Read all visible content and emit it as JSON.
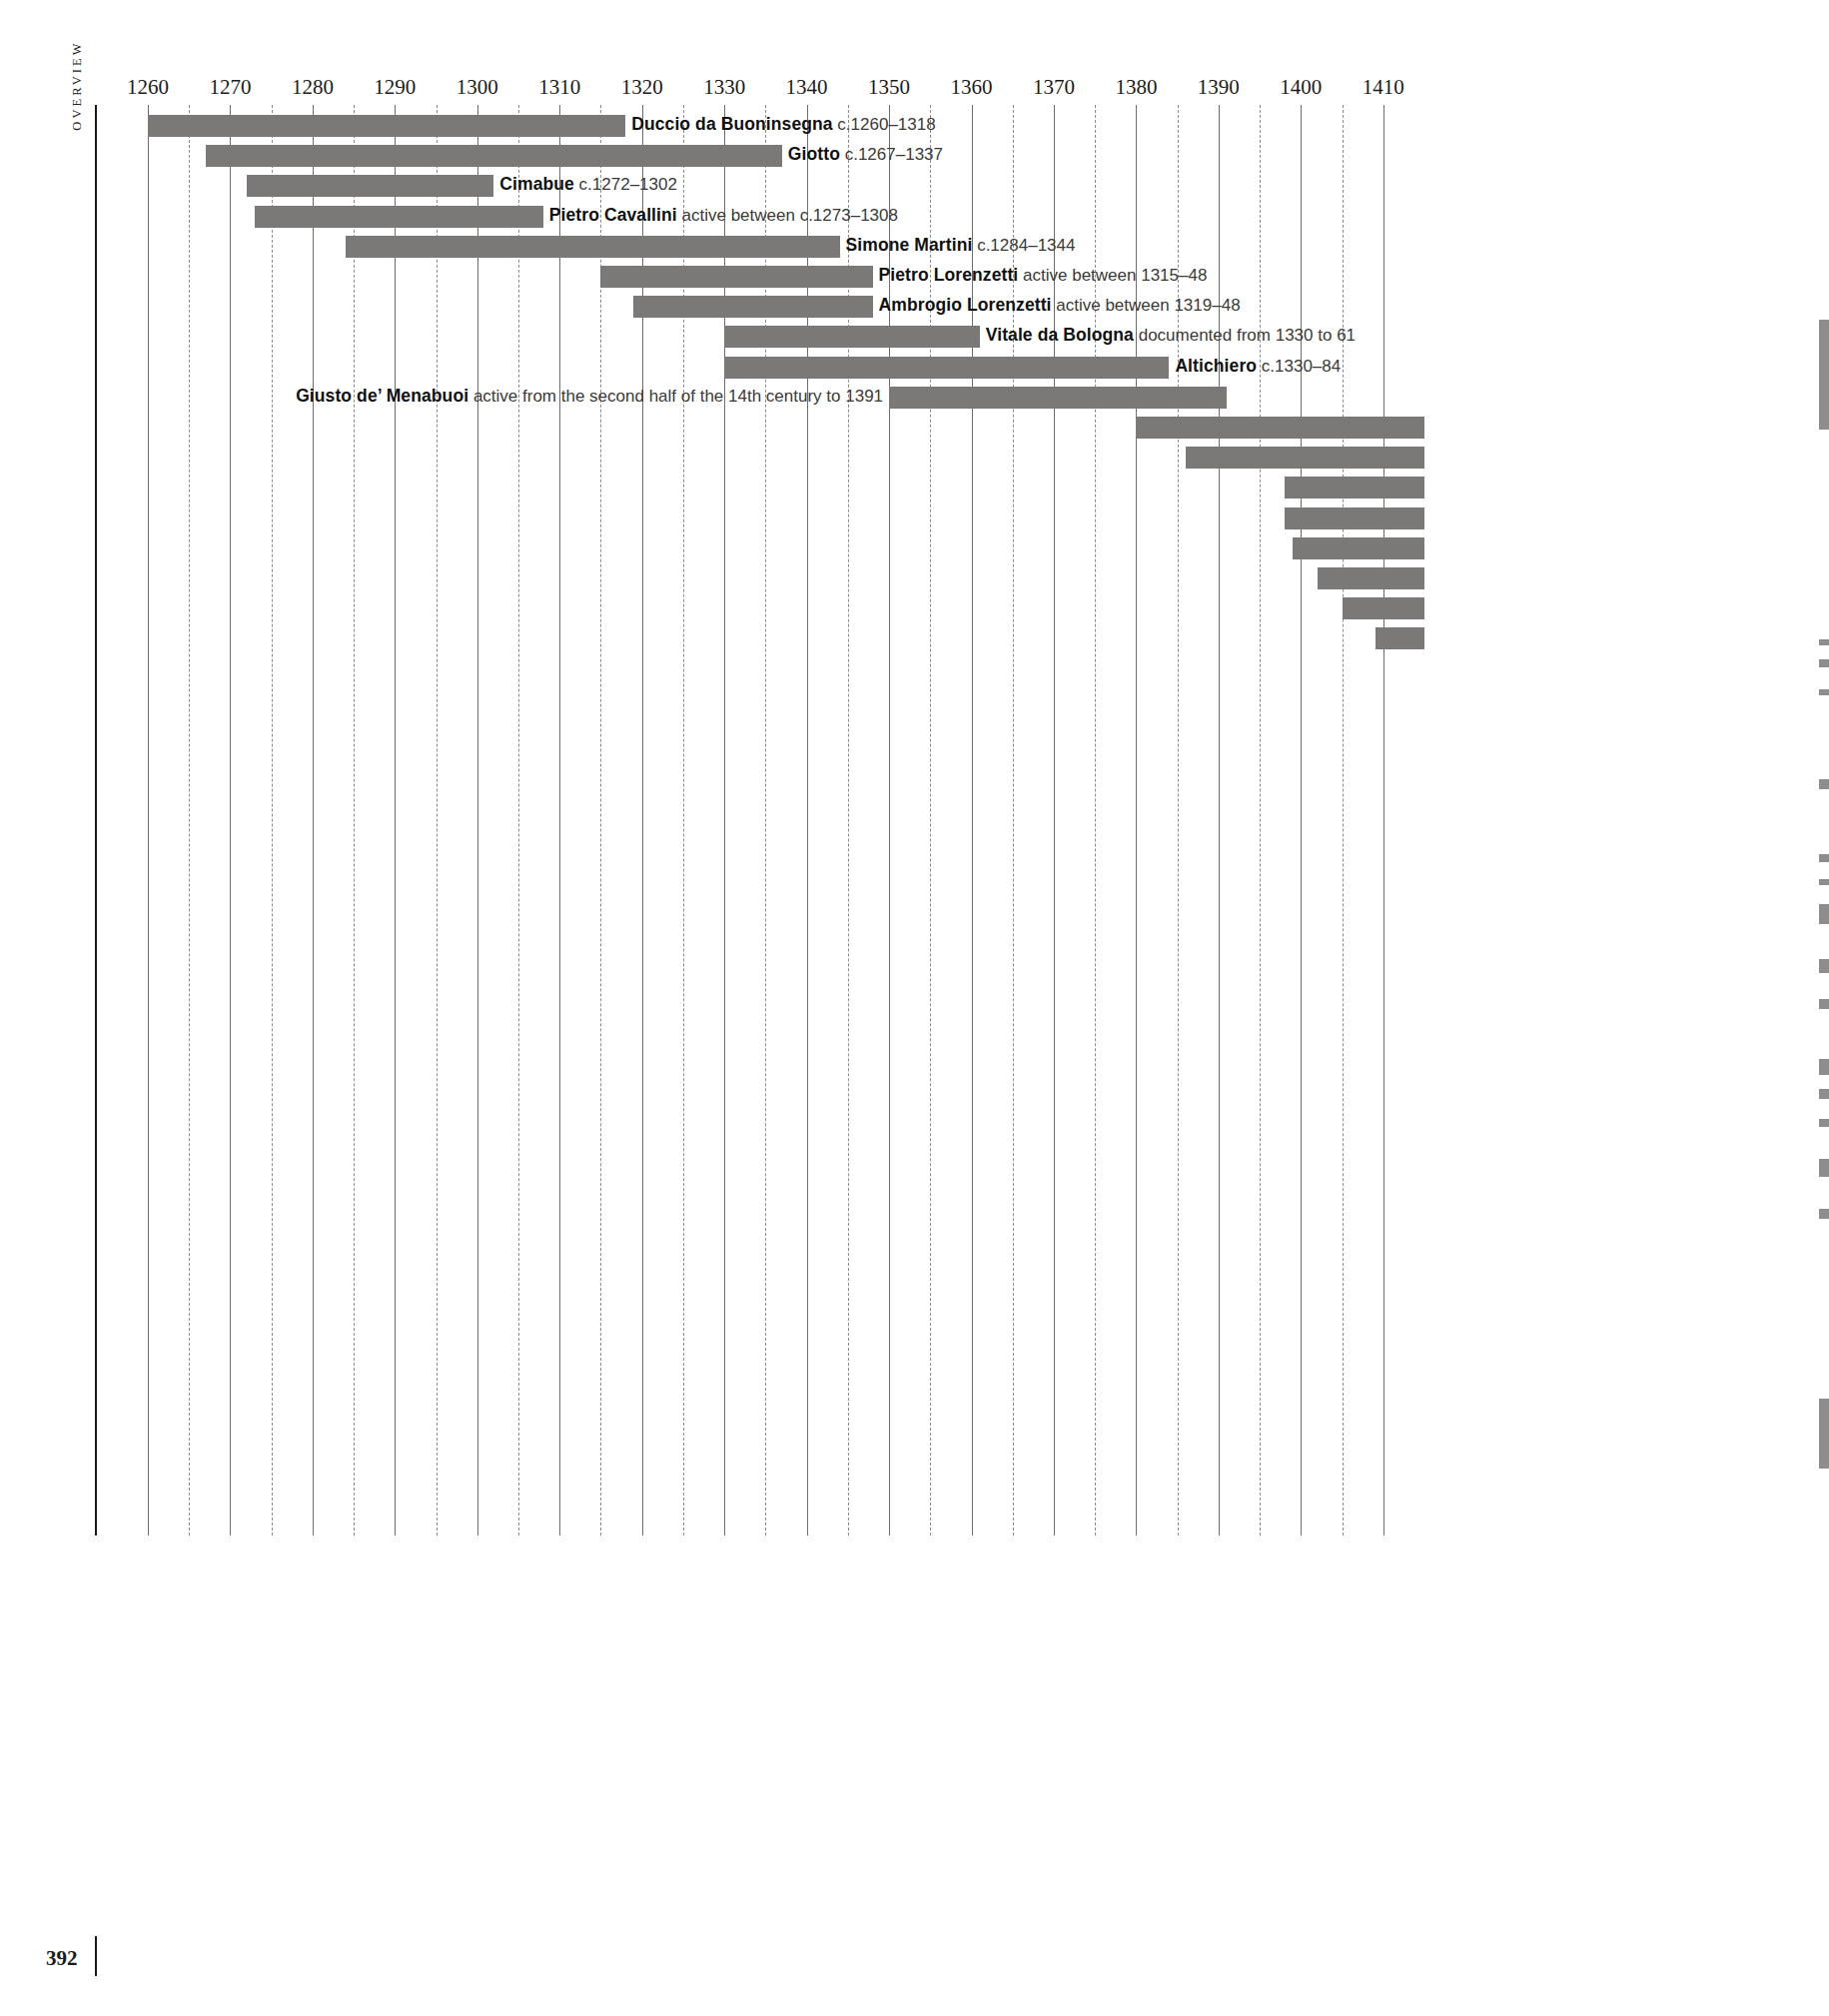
{
  "section_label": "OVERVIEW",
  "folio": "392",
  "chart_data": {
    "type": "bar",
    "orientation": "horizontal",
    "title": "",
    "subtitle": "",
    "xlabel": "",
    "ylabel": "",
    "xlim": [
      1255,
      1415
    ],
    "grid": true,
    "grid_major_step": 10,
    "grid_minor_step": 5,
    "legend": "none",
    "bar_color": "#7b7977",
    "axis_color": "#1c1a19",
    "tick_labels": [
      "1260",
      "1270",
      "1280",
      "1290",
      "1300",
      "1310",
      "1320",
      "1330",
      "1340",
      "1350",
      "1360",
      "1370",
      "1380",
      "1390",
      "1400",
      "1410"
    ],
    "ticks": [
      1260,
      1270,
      1280,
      1290,
      1300,
      1310,
      1320,
      1330,
      1340,
      1350,
      1360,
      1370,
      1380,
      1390,
      1400,
      1410
    ],
    "minor_ticks": [
      1265,
      1275,
      1285,
      1295,
      1305,
      1315,
      1325,
      1335,
      1345,
      1355,
      1365,
      1375,
      1385,
      1395,
      1405
    ],
    "categories": [
      "Duccio da Buoninsegna",
      "Giotto",
      "Cimabue",
      "Pietro Cavallini",
      "Simone Martini",
      "Pietro Lorenzetti",
      "Ambrogio Lorenzetti",
      "Vitale da Bologna",
      "Altichiero",
      "Giusto de’ Menabuoi"
    ],
    "bars": [
      {
        "name": "Duccio da Buoninsegna",
        "dates": "c.1260–1318",
        "start": 1260,
        "end": 1318,
        "label_side": "right"
      },
      {
        "name": "Giotto",
        "dates": "c.1267–1337",
        "start": 1267,
        "end": 1337,
        "label_side": "right"
      },
      {
        "name": "Cimabue",
        "dates": "c.1272–1302",
        "start": 1272,
        "end": 1302,
        "label_side": "right"
      },
      {
        "name": "Pietro Cavallini",
        "dates": "active between c.1273–1308",
        "start": 1273,
        "end": 1308,
        "label_side": "right"
      },
      {
        "name": "Simone Martini",
        "dates": "c.1284–1344",
        "start": 1284,
        "end": 1344,
        "label_side": "right"
      },
      {
        "name": "Pietro Lorenzetti",
        "dates": "active between 1315–48",
        "start": 1315,
        "end": 1348,
        "label_side": "right"
      },
      {
        "name": "Ambrogio Lorenzetti",
        "dates": "active between 1319–48",
        "start": 1319,
        "end": 1348,
        "label_side": "right"
      },
      {
        "name": "Vitale da Bologna",
        "dates": "documented from 1330 to 61",
        "start": 1330,
        "end": 1361,
        "label_side": "right"
      },
      {
        "name": "Altichiero",
        "dates": "c.1330–84",
        "start": 1330,
        "end": 1384,
        "label_side": "right"
      },
      {
        "name": "Giusto de’ Menabuoi",
        "dates": "active from the second half of the 14th century to 1391",
        "start": 1350,
        "end": 1391,
        "label_side": "left"
      },
      {
        "name": "",
        "dates": "",
        "start": 1380,
        "end": 1415,
        "label_side": "none"
      },
      {
        "name": "",
        "dates": "",
        "start": 1386,
        "end": 1415,
        "label_side": "none"
      },
      {
        "name": "",
        "dates": "",
        "start": 1398,
        "end": 1415,
        "label_side": "none"
      },
      {
        "name": "",
        "dates": "",
        "start": 1398,
        "end": 1415,
        "label_side": "none"
      },
      {
        "name": "",
        "dates": "",
        "start": 1399,
        "end": 1415,
        "label_side": "none"
      },
      {
        "name": "",
        "dates": "",
        "start": 1402,
        "end": 1415,
        "label_side": "none"
      },
      {
        "name": "",
        "dates": "",
        "start": 1405,
        "end": 1415,
        "label_side": "none"
      },
      {
        "name": "",
        "dates": "",
        "start": 1409,
        "end": 1415,
        "label_side": "none"
      }
    ]
  }
}
